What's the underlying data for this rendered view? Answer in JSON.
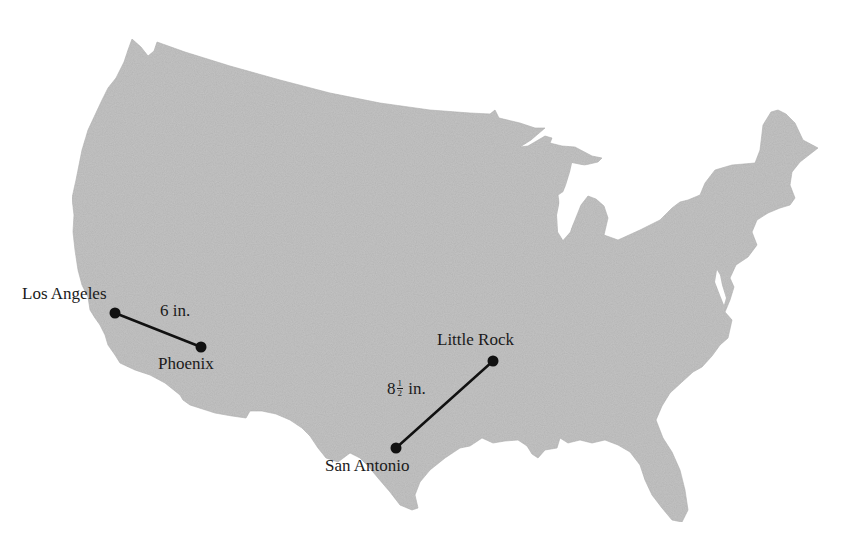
{
  "map": {
    "title": "",
    "region": "Contiguous United States",
    "land_color": "#c4c4c4",
    "background_color": "#ffffff",
    "line_color": "#111111"
  },
  "cities": [
    {
      "name": "Los Angeles",
      "x": 115,
      "y": 313,
      "label_x": 22,
      "label_y": 287
    },
    {
      "name": "Phoenix",
      "x": 201,
      "y": 347,
      "label_x": 158,
      "label_y": 357
    },
    {
      "name": "Little Rock",
      "x": 493,
      "y": 361,
      "label_x": 437,
      "label_y": 333
    },
    {
      "name": "San Antonio",
      "x": 396,
      "y": 448,
      "label_x": 325,
      "label_y": 459
    }
  ],
  "routes": [
    {
      "from": "Los Angeles",
      "to": "Phoenix",
      "distance_label": "6 in.",
      "label_x": 160,
      "label_y": 304
    },
    {
      "from": "San Antonio",
      "to": "Little Rock",
      "distance_whole": "8",
      "distance_num": "1",
      "distance_den": "2",
      "distance_unit": "in.",
      "label_x": 387,
      "label_y": 384
    }
  ]
}
